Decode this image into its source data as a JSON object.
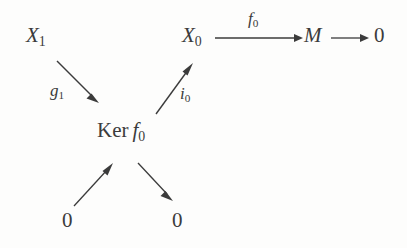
{
  "figure": {
    "kind": "commutative-diagram",
    "background_color": "#fdfdfc",
    "ink_color": "#3b3b3b"
  },
  "nodes": {
    "x1": {
      "base": "X",
      "sub": "1",
      "full": "X₁"
    },
    "x0": {
      "base": "X",
      "sub": "0",
      "full": "X₀"
    },
    "m": {
      "base": "M",
      "sub": "",
      "full": "M"
    },
    "zero_right": {
      "full": "0"
    },
    "ker": {
      "word": "Ker",
      "fn_base": "f",
      "fn_sub": "0",
      "full": "Ker f₀"
    },
    "zero_bottom_left": {
      "full": "0"
    },
    "zero_bottom_right": {
      "full": "0"
    }
  },
  "arrow_labels": {
    "g1": {
      "base": "g",
      "sub": "1",
      "full": "g₁"
    },
    "i0": {
      "base": "i",
      "sub": "0",
      "full": "i₀"
    },
    "f0": {
      "base": "f",
      "sub": "0",
      "full": "f₀"
    }
  },
  "arrows": [
    {
      "name": "x1-to-ker",
      "label": "g₁",
      "from": "X₁",
      "to": "Ker f₀",
      "direction": "down-right"
    },
    {
      "name": "ker-to-x0",
      "label": "i₀",
      "from": "Ker f₀",
      "to": "X₀",
      "direction": "up-right"
    },
    {
      "name": "x0-to-m",
      "label": "f₀",
      "from": "X₀",
      "to": "M",
      "direction": "right"
    },
    {
      "name": "m-to-zero",
      "label": "",
      "from": "M",
      "to": "0",
      "direction": "right"
    },
    {
      "name": "zero-to-ker",
      "label": "",
      "from": "0",
      "to": "Ker f₀",
      "direction": "up-right"
    },
    {
      "name": "ker-to-zero",
      "label": "",
      "from": "Ker f₀",
      "to": "0",
      "direction": "down-right"
    }
  ]
}
